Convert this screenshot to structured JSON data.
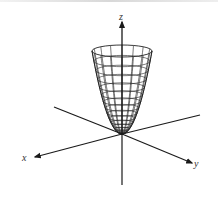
{
  "figure": {
    "surface": "paraboloid",
    "axes": {
      "x": {
        "label": "x"
      },
      "y": {
        "label": "y"
      },
      "z": {
        "label": "z"
      }
    },
    "colors": {
      "line": "#1a1a1a",
      "mesh": "#222222",
      "background": "#ffffff"
    },
    "mesh": {
      "rings": 16,
      "meridians": 16
    }
  }
}
